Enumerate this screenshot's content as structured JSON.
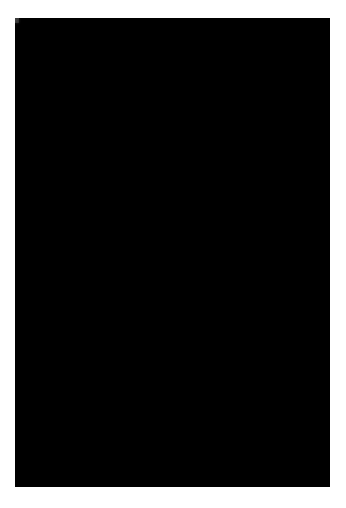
{
  "document": {
    "kind": "mammogram-radiograph",
    "modality": "X-ray mammography",
    "view": "mediolateral-oblique",
    "laterality": "left",
    "page_background": "#ffffff",
    "margins_px": {
      "left": 15,
      "top": 18,
      "right": 16,
      "bottom": 21
    }
  },
  "image": {
    "width": 315,
    "height": 469,
    "background_air": "#1a1a1a",
    "tissue_midtone": "#8c8c8c",
    "tissue_bright": "#f2f2f2",
    "skin_edge": "#bdbdbd",
    "grain_opacity": 0.3,
    "colors": {
      "air_dark": "#151515",
      "air_light": "#2a2a2a",
      "fat_gray": "#7e7e7e",
      "fibroglandular": "#efefef",
      "highlight": "#fdfdfd"
    },
    "regions": [
      {
        "name": "air-background-upper-left",
        "note": "near-black triangle above breast contour"
      },
      {
        "name": "air-background-lower-left",
        "note": "near-black wedge below inferior skin line"
      },
      {
        "name": "breast-parenchyma",
        "note": "mid-gray fatty tissue filling right two-thirds"
      },
      {
        "name": "superior-fibroglandular-band",
        "note": "bright arc sweeping from upper-left to upper-right"
      },
      {
        "name": "retroareolar-density",
        "note": "dense white wedge converging at the nipple"
      },
      {
        "name": "nipple",
        "note": "anterior point at left margin, mid-height"
      },
      {
        "name": "inferior-skin-line",
        "note": "bright diagonal band toward lower-right"
      },
      {
        "name": "focal-density-central",
        "note": "bright nodular opacity in central breast"
      },
      {
        "name": "focal-density-lower-right",
        "note": "smaller bright opacity inferolaterally"
      }
    ],
    "features": [
      {
        "id": "contour",
        "type": "breast-outline",
        "cx": 0.02,
        "cy": 0.56,
        "rx": 1.06,
        "ry": 0.5
      },
      {
        "id": "nipple",
        "type": "point",
        "x": 0.06,
        "y": 0.57
      },
      {
        "id": "band-superior",
        "type": "arc",
        "x": 0.55,
        "y": 0.2,
        "w": 0.78,
        "h": 0.12
      },
      {
        "id": "band-inferior",
        "type": "arc",
        "x": 0.4,
        "y": 0.8,
        "w": 0.62,
        "h": 0.1
      },
      {
        "id": "node-central",
        "type": "blob",
        "x": 0.67,
        "y": 0.49,
        "r": 0.052
      },
      {
        "id": "node-lower-right",
        "type": "blob",
        "x": 0.82,
        "y": 0.64,
        "r": 0.042
      },
      {
        "id": "node-upper-mid",
        "type": "blob",
        "x": 0.45,
        "y": 0.43,
        "r": 0.05
      },
      {
        "id": "node-retro",
        "type": "blob",
        "x": 0.2,
        "y": 0.57,
        "r": 0.068
      }
    ],
    "noise": {
      "seed": 20240517,
      "amount": 18,
      "speckle": 0.42
    }
  }
}
